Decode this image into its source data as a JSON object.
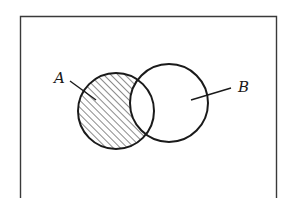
{
  "diagram": {
    "type": "venn",
    "title": "",
    "universe_frame": {
      "x": 20,
      "y": 16,
      "width": 257,
      "height": 190,
      "stroke": "#3a3a3a",
      "open_bottom": true
    },
    "sets": [
      {
        "id": "A",
        "label": "A",
        "cx": 116,
        "cy": 111,
        "r": 38,
        "label_pos": {
          "x": 54,
          "y": 71
        },
        "leader": {
          "x1": 70,
          "y1": 81,
          "x2": 96,
          "y2": 100
        }
      },
      {
        "id": "B",
        "label": "B",
        "cx": 169,
        "cy": 103,
        "r": 39,
        "label_pos": {
          "x": 238,
          "y": 80
        },
        "leader": {
          "x1": 191,
          "y1": 100,
          "x2": 231,
          "y2": 88
        }
      }
    ],
    "shaded_region": "A - B",
    "shading": {
      "style": "diagonal-hatch",
      "spacing": 5,
      "color": "#2a2a2a"
    },
    "stroke_color": "#1a1a1a"
  }
}
